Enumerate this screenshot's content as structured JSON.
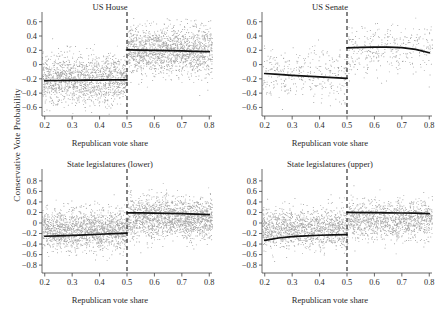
{
  "figure": {
    "ylabel": "Conservative Vote Probability",
    "xlabel": "Republican vote share",
    "point_color": "#8a8a8a",
    "line_color": "#111111",
    "axis_color": "#444444",
    "background": "#ffffff"
  },
  "chart_data": [
    {
      "type": "scatter",
      "title": "US House",
      "xlabel": "Republican vote share",
      "ylabel": "Conservative Vote Probability",
      "xlim": [
        0.19,
        0.81
      ],
      "ylim": [
        -0.72,
        0.68
      ],
      "xticks": [
        0.2,
        0.3,
        0.4,
        0.5,
        0.6,
        0.7,
        0.8
      ],
      "xticklabels": [
        "0.2",
        "0.3",
        "0.4",
        "0.5",
        "0.6",
        "0.7",
        "0.8"
      ],
      "yticks": [
        -0.6,
        -0.4,
        -0.2,
        0,
        0.2,
        0.4,
        0.6
      ],
      "yticklabels": [
        "-0.6",
        "-0.4",
        "-0.2",
        "0",
        "0.2",
        "0.4",
        "0.6"
      ],
      "grid": false,
      "legend": "none",
      "cutoff": 0.5,
      "cutoff_style": "dashed-vertical",
      "n_points": 3200,
      "cloud_density": "very-dense",
      "point_spread": 0.175,
      "series": [
        {
          "name": "fit-left",
          "x": [
            0.2,
            0.25,
            0.3,
            0.35,
            0.4,
            0.45,
            0.5
          ],
          "values": [
            -0.225,
            -0.223,
            -0.221,
            -0.219,
            -0.217,
            -0.215,
            -0.213
          ]
        },
        {
          "name": "fit-right",
          "x": [
            0.5,
            0.55,
            0.6,
            0.65,
            0.7,
            0.75,
            0.8
          ],
          "values": [
            0.205,
            0.203,
            0.2,
            0.196,
            0.191,
            0.186,
            0.18
          ]
        }
      ],
      "cloud_center_left": -0.2,
      "cloud_center_right": 0.2
    },
    {
      "type": "scatter",
      "title": "US Senate",
      "xlabel": "Republican vote share",
      "ylabel": "Conservative Vote Probability",
      "xlim": [
        0.19,
        0.81
      ],
      "ylim": [
        -0.72,
        0.68
      ],
      "xticks": [
        0.2,
        0.3,
        0.4,
        0.5,
        0.6,
        0.7,
        0.8
      ],
      "xticklabels": [
        "0.2",
        "0.3",
        "0.4",
        "0.5",
        "0.6",
        "0.7",
        "0.8"
      ],
      "yticks": [
        -0.6,
        -0.4,
        -0.2,
        0,
        0.2,
        0.4,
        0.6
      ],
      "yticklabels": [
        "-0.6",
        "-0.4",
        "-0.2",
        "0",
        "0.2",
        "0.4",
        "0.6"
      ],
      "grid": false,
      "legend": "none",
      "cutoff": 0.5,
      "cutoff_style": "dashed-vertical",
      "n_points": 700,
      "cloud_density": "sparse",
      "point_spread": 0.17,
      "series": [
        {
          "name": "fit-left",
          "x": [
            0.2,
            0.25,
            0.3,
            0.35,
            0.4,
            0.45,
            0.5
          ],
          "values": [
            -0.125,
            -0.138,
            -0.15,
            -0.162,
            -0.173,
            -0.183,
            -0.193
          ]
        },
        {
          "name": "fit-right",
          "x": [
            0.5,
            0.55,
            0.6,
            0.65,
            0.7,
            0.75,
            0.8
          ],
          "values": [
            0.233,
            0.24,
            0.243,
            0.243,
            0.237,
            0.212,
            0.165
          ]
        }
      ],
      "cloud_center_left": -0.14,
      "cloud_center_right": 0.23
    },
    {
      "type": "scatter",
      "title": "State legislatures (lower)",
      "xlabel": "Republican vote share",
      "ylabel": "Conservative Vote Probability",
      "xlim": [
        0.19,
        0.81
      ],
      "ylim": [
        -0.95,
        0.95
      ],
      "xticks": [
        0.2,
        0.3,
        0.4,
        0.5,
        0.6,
        0.7,
        0.8
      ],
      "xticklabels": [
        "0.2",
        "0.3",
        "0.4",
        "0.5",
        "0.6",
        "0.7",
        "0.8"
      ],
      "yticks": [
        -0.8,
        -0.6,
        -0.4,
        -0.2,
        0,
        0.2,
        0.4,
        0.6,
        0.8
      ],
      "yticklabels": [
        "-0.8",
        "-0.6",
        "-0.4",
        "-0.2",
        "0",
        "0.2",
        "0.4",
        "0.6",
        "0.8"
      ],
      "grid": false,
      "legend": "none",
      "cutoff": 0.5,
      "cutoff_style": "dashed-vertical",
      "n_points": 3400,
      "cloud_density": "very-dense",
      "point_spread": 0.19,
      "series": [
        {
          "name": "fit-left",
          "x": [
            0.2,
            0.25,
            0.3,
            0.35,
            0.4,
            0.45,
            0.5
          ],
          "values": [
            -0.252,
            -0.243,
            -0.234,
            -0.225,
            -0.214,
            -0.203,
            -0.192
          ]
        },
        {
          "name": "fit-right",
          "x": [
            0.5,
            0.55,
            0.6,
            0.65,
            0.7,
            0.75,
            0.8
          ],
          "values": [
            0.192,
            0.191,
            0.188,
            0.183,
            0.177,
            0.17,
            0.16
          ]
        }
      ],
      "cloud_center_left": -0.12,
      "cloud_center_right": 0.1
    },
    {
      "type": "scatter",
      "title": "State legislatures (upper)",
      "xlabel": "Republican vote share",
      "ylabel": "Conservative Vote Probability",
      "xlim": [
        0.19,
        0.81
      ],
      "ylim": [
        -0.95,
        0.95
      ],
      "xticks": [
        0.2,
        0.3,
        0.4,
        0.5,
        0.6,
        0.7,
        0.8
      ],
      "xticklabels": [
        "0.2",
        "0.3",
        "0.4",
        "0.5",
        "0.6",
        "0.7",
        "0.8"
      ],
      "yticks": [
        -0.8,
        -0.6,
        -0.4,
        -0.2,
        0,
        0.2,
        0.4,
        0.6,
        0.8
      ],
      "yticklabels": [
        "-0.8",
        "-0.6",
        "-0.4",
        "-0.2",
        "0",
        "0.2",
        "0.4",
        "0.6",
        "0.8"
      ],
      "grid": false,
      "legend": "none",
      "cutoff": 0.5,
      "cutoff_style": "dashed-vertical",
      "n_points": 2600,
      "cloud_density": "dense",
      "point_spread": 0.185,
      "series": [
        {
          "name": "fit-left",
          "x": [
            0.2,
            0.25,
            0.3,
            0.35,
            0.4,
            0.45,
            0.5
          ],
          "values": [
            -0.33,
            -0.285,
            -0.258,
            -0.243,
            -0.233,
            -0.227,
            -0.222
          ]
        },
        {
          "name": "fit-right",
          "x": [
            0.5,
            0.55,
            0.6,
            0.65,
            0.7,
            0.75,
            0.8
          ],
          "values": [
            0.2,
            0.198,
            0.196,
            0.193,
            0.19,
            0.186,
            0.178
          ]
        }
      ],
      "cloud_center_left": -0.1,
      "cloud_center_right": 0.07
    }
  ]
}
